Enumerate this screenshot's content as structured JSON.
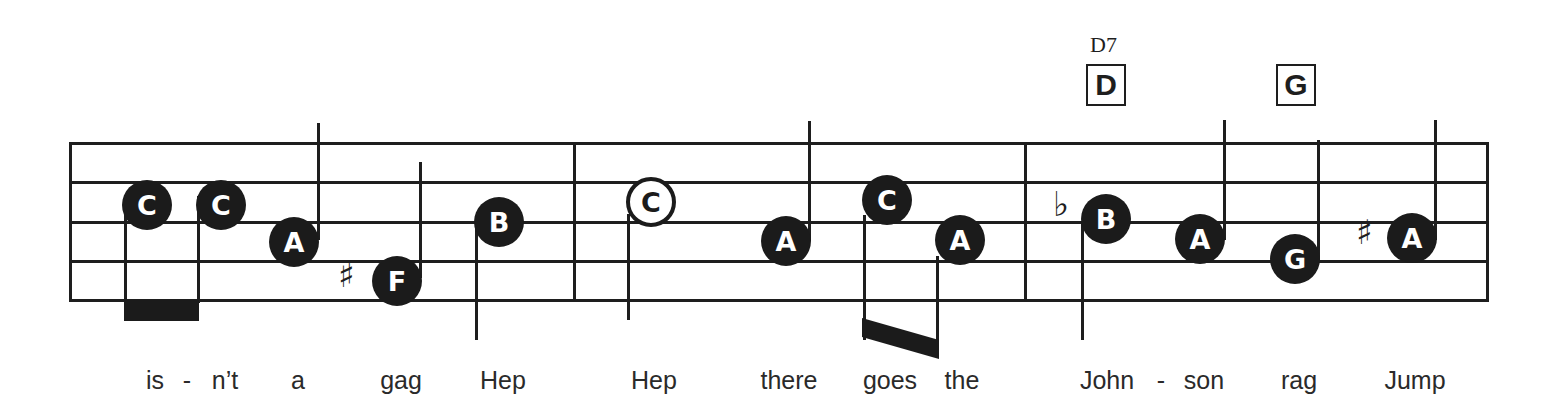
{
  "chords": [
    {
      "name": "D7",
      "box": "D"
    },
    {
      "box": "G"
    }
  ],
  "notes": [
    {
      "letter": "C",
      "filled": true
    },
    {
      "letter": "C",
      "filled": true
    },
    {
      "letter": "A",
      "filled": true
    },
    {
      "letter": "F",
      "filled": true,
      "accidental": "♯"
    },
    {
      "letter": "B",
      "filled": true
    },
    {
      "letter": "C",
      "filled": false
    },
    {
      "letter": "A",
      "filled": true
    },
    {
      "letter": "C",
      "filled": true
    },
    {
      "letter": "A",
      "filled": true
    },
    {
      "letter": "B",
      "filled": true,
      "accidental": "♭"
    },
    {
      "letter": "A",
      "filled": true
    },
    {
      "letter": "G",
      "filled": true
    },
    {
      "letter": "A",
      "filled": true,
      "accidental": "♯"
    }
  ],
  "lyrics": [
    "is",
    "-",
    "n’t",
    "a",
    "gag",
    "Hep",
    "Hep",
    "there",
    "goes",
    "the",
    "John",
    "-",
    "son",
    "rag",
    "Jump"
  ],
  "colors": {
    "ink": "#1b1b1b",
    "background": "#ffffff"
  }
}
